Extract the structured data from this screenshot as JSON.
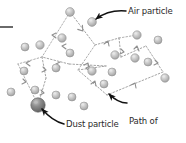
{
  "figure": {
    "background_color": "#ffffff",
    "width": 186,
    "height": 143
  },
  "labels": {
    "air_particle": "Air particle",
    "path_line1": "Path of",
    "path_line2": "dust particle",
    "dust_particle": "Dust particle"
  },
  "colors": {
    "air_particle_fill": "#b9b9b9",
    "air_particle_highlight": "#e6e6e6",
    "air_particle_stroke": "#8e8e8e",
    "dust_particle_fill": "#7d7d7d",
    "dust_particle_highlight": "#bdbdbd",
    "dust_particle_stroke": "#5a5a5a",
    "path_line": "#9a9a9a",
    "annotation_arrow": "#111111",
    "text": "#2b2b2b",
    "margin_mark": "#444444"
  },
  "chart_data": {
    "type": "scatter",
    "xlabel": "",
    "ylabel": "",
    "grid": false,
    "legend": "none",
    "air_particles": [
      {
        "id": "a1",
        "x": 70,
        "y": 12,
        "r": 4.4
      },
      {
        "id": "a2",
        "x": 92,
        "y": 22,
        "r": 4.4
      },
      {
        "id": "a3",
        "x": 62,
        "y": 38,
        "r": 4.2
      },
      {
        "id": "a4",
        "x": 40,
        "y": 45,
        "r": 4.2
      },
      {
        "id": "a5",
        "x": 25,
        "y": 47,
        "r": 4.0
      },
      {
        "id": "a6",
        "x": 137,
        "y": 35,
        "r": 4.2
      },
      {
        "id": "a7",
        "x": 158,
        "y": 40,
        "r": 4.0
      },
      {
        "id": "a8",
        "x": 70,
        "y": 53,
        "r": 4.0
      },
      {
        "id": "a9",
        "x": 115,
        "y": 55,
        "r": 4.2
      },
      {
        "id": "a10",
        "x": 135,
        "y": 58,
        "r": 4.2
      },
      {
        "id": "a11",
        "x": 24,
        "y": 71,
        "r": 4.0
      },
      {
        "id": "a12",
        "x": 56,
        "y": 68,
        "r": 4.0
      },
      {
        "id": "a13",
        "x": 92,
        "y": 71,
        "r": 4.2
      },
      {
        "id": "a14",
        "x": 112,
        "y": 72,
        "r": 4.0
      },
      {
        "id": "a15",
        "x": 165,
        "y": 78,
        "r": 4.2
      },
      {
        "id": "a16",
        "x": 11,
        "y": 92,
        "r": 4.0
      },
      {
        "id": "a17",
        "x": 35,
        "y": 90,
        "r": 4.0
      },
      {
        "id": "a18",
        "x": 56,
        "y": 95,
        "r": 4.0
      },
      {
        "id": "a19",
        "x": 72,
        "y": 97,
        "r": 4.0
      },
      {
        "id": "a20",
        "x": 104,
        "y": 84,
        "r": 4.0
      },
      {
        "id": "a21",
        "x": 148,
        "y": 62,
        "r": 4.0
      },
      {
        "id": "a22",
        "x": 84,
        "y": 106,
        "r": 4.0
      }
    ],
    "dust_particle": {
      "id": "dust",
      "x": 38,
      "y": 105,
      "r": 7.2
    },
    "path_vertices": [
      {
        "x": 70,
        "y": 12
      },
      {
        "x": 95,
        "y": 45
      },
      {
        "x": 119,
        "y": 38
      },
      {
        "x": 121,
        "y": 57
      },
      {
        "x": 146,
        "y": 46
      },
      {
        "x": 163,
        "y": 72
      },
      {
        "x": 107,
        "y": 95
      },
      {
        "x": 78,
        "y": 70
      },
      {
        "x": 106,
        "y": 66
      },
      {
        "x": 69,
        "y": 64
      },
      {
        "x": 42,
        "y": 57
      },
      {
        "x": 46,
        "y": 78
      },
      {
        "x": 38,
        "y": 105
      }
    ],
    "path_branches": [
      [
        {
          "x": 70,
          "y": 12
        },
        {
          "x": 42,
          "y": 57
        }
      ],
      [
        {
          "x": 42,
          "y": 57
        },
        {
          "x": 18,
          "y": 64
        }
      ],
      [
        {
          "x": 18,
          "y": 64
        },
        {
          "x": 38,
          "y": 105
        }
      ],
      [
        {
          "x": 95,
          "y": 45
        },
        {
          "x": 78,
          "y": 70
        }
      ]
    ],
    "annotations": [
      {
        "label": "Air particle",
        "points_to": {
          "x": 92,
          "y": 22
        }
      },
      {
        "label": "Path of dust particle",
        "points_to": {
          "x": 107,
          "y": 95
        }
      },
      {
        "label": "Dust particle",
        "points_to": {
          "x": 38,
          "y": 105
        }
      }
    ]
  }
}
